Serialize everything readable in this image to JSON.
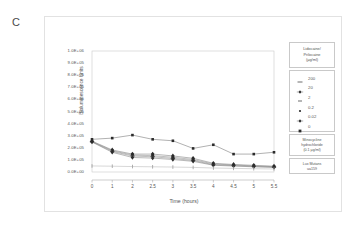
{
  "panel": {
    "label": "C"
  },
  "axes": {
    "ylabel": "Bioluminescence Units",
    "xlabel": "Time (hours)",
    "yticks": [
      "0.0E+00",
      "1.0E+05",
      "2.0E+05",
      "3.0E+05",
      "4.0E+05",
      "5.0E+05",
      "6.0E+05",
      "7.0E+05",
      "8.0E+05",
      "9.0E+05",
      "1.0E+06"
    ],
    "xticks": [
      "0",
      "1",
      "2",
      "2.5",
      "3",
      "3.5",
      "4",
      "4.5",
      "5",
      "5.5"
    ]
  },
  "legend": {
    "title_line1": "Lidocaine/",
    "title_line2": "Prilocaine",
    "title_line3": "(µg/ml)",
    "items": [
      {
        "label": "200",
        "marker": "dash"
      },
      {
        "label": "20",
        "marker": "dot-line"
      },
      {
        "label": "2",
        "marker": "dash-small"
      },
      {
        "label": "0.2",
        "marker": "dot"
      },
      {
        "label": "0.02",
        "marker": "dot-line"
      },
      {
        "label": "0",
        "marker": "square"
      }
    ],
    "note1_line1": "Minocycline",
    "note1_line2": "hydrochloride",
    "note1_line3": "(0.1 µg/ml)",
    "note2_line1": "Lux Mutans",
    "note2_line2": "ua159"
  },
  "chart_data": {
    "type": "line",
    "title": "",
    "subtitle": "",
    "xlabel": "Time (hours)",
    "ylabel": "Bioluminescence Units",
    "x": [
      0,
      1,
      2,
      2.5,
      3,
      3.5,
      4,
      4.5,
      5,
      5.5
    ],
    "xtick_labels": [
      "0",
      "1",
      "2",
      "2.5",
      "3",
      "3.5",
      "4",
      "4.5",
      "5",
      "5.5"
    ],
    "ylim": [
      0,
      1000000
    ],
    "ytick_values": [
      0,
      100000,
      200000,
      300000,
      400000,
      500000,
      600000,
      700000,
      800000,
      900000,
      1000000
    ],
    "grid": false,
    "legend_position": "right",
    "legend_title": "Lidocaine/Prilocaine (µg/ml)",
    "annotations": [
      "Minocycline hydrochloride (0.1 µg/ml)",
      "Lux Mutans ua159"
    ],
    "series": [
      {
        "name": "0",
        "values": [
          270000,
          280000,
          305000,
          270000,
          258000,
          195000,
          225000,
          148000,
          148000,
          163000
        ]
      },
      {
        "name": "0.02",
        "values": [
          255000,
          182000,
          148000,
          148000,
          133000,
          113000,
          72000,
          62000,
          55000,
          48000
        ]
      },
      {
        "name": "0.2",
        "values": [
          252000,
          176000,
          140000,
          135000,
          122000,
          103000,
          66000,
          58000,
          50000,
          44000
        ]
      },
      {
        "name": "2",
        "values": [
          250000,
          170000,
          132000,
          126000,
          112000,
          95000,
          60000,
          53000,
          46000,
          41000
        ]
      },
      {
        "name": "20",
        "values": [
          248000,
          163000,
          120000,
          115000,
          103000,
          88000,
          56000,
          49000,
          43000,
          38000
        ]
      },
      {
        "name": "200",
        "values": [
          50000,
          48000,
          45000,
          43000,
          41000,
          38000,
          33000,
          30000,
          27000,
          25000
        ]
      }
    ]
  }
}
